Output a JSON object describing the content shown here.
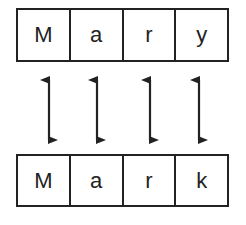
{
  "top_word": {
    "letters": [
      "M",
      "a",
      "r",
      "y"
    ]
  },
  "bottom_word": {
    "letters": [
      "M",
      "a",
      "r",
      "k"
    ]
  },
  "arrows": {
    "count": 4,
    "style": "double-headed"
  },
  "colors": {
    "stroke": "#222222",
    "background": "#ffffff"
  }
}
